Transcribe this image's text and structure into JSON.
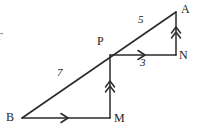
{
  "figure": {
    "type": "geometry-diagram",
    "stroke_color": "#2b2b2b",
    "background_color": "#ffffff",
    "vertices": [
      {
        "name": "A",
        "label": "A",
        "x": 176,
        "y": 12,
        "label_x": 181,
        "label_y": 4
      },
      {
        "name": "P",
        "label": "P",
        "x": 110,
        "y": 55,
        "label_x": 98,
        "label_y": 36
      },
      {
        "name": "N",
        "label": "N",
        "x": 176,
        "y": 55,
        "label_x": 180,
        "label_y": 50
      },
      {
        "name": "B",
        "label": "B",
        "x": 22,
        "y": 118,
        "label_x": 7,
        "label_y": 112
      },
      {
        "name": "M",
        "label": "M",
        "x": 110,
        "y": 118,
        "label_x": 114,
        "label_y": 113
      }
    ],
    "segments": [
      {
        "name": "hypotenuse-B-to-A",
        "from": "B",
        "to": "A",
        "arrow": "none"
      },
      {
        "name": "base-B-to-M",
        "from": "B",
        "to": "M",
        "arrow": "single-right",
        "arrow_at": 0.5
      },
      {
        "name": "vertical-M-to-P",
        "from": "M",
        "to": "P",
        "arrow": "double-up",
        "arrow_at": 0.5
      },
      {
        "name": "horizontal-P-to-N",
        "from": "P",
        "to": "N",
        "arrow": "single-right",
        "arrow_at": 0.5
      },
      {
        "name": "vertical-N-to-A",
        "from": "N",
        "to": "A",
        "arrow": "double-up",
        "arrow_at": 0.5
      }
    ],
    "measurements": [
      {
        "name": "length-P-to-A",
        "value": "5",
        "x": 141,
        "y": 20,
        "on_segment": "P-A"
      },
      {
        "name": "length-B-to-P",
        "value": "7",
        "x": 60,
        "y": 73,
        "on_segment": "B-P"
      },
      {
        "name": "length-P-to-N",
        "value": "3",
        "x": 142,
        "y": 60,
        "on_segment": "P-N"
      }
    ],
    "edge_artifact": {
      "name": "clipped-glyph",
      "text": "Γ"
    }
  }
}
